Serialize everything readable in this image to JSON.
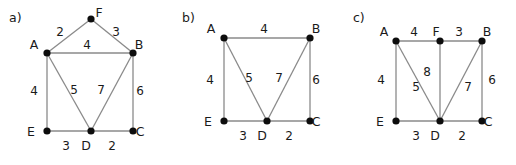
{
  "figure": {
    "width": 516,
    "height": 165,
    "background": "#ffffff",
    "edge_color": "#8a8a8a",
    "node_color": "#0d0d0d",
    "text_color": "#1a1a1a"
  },
  "panels": [
    {
      "id": "a",
      "label": "a)",
      "label_pos": {
        "x": 9,
        "y": 22
      },
      "nodes": [
        {
          "id": "F",
          "label": "F",
          "x": 91,
          "y": 19,
          "label_x": 99,
          "label_y": 17
        },
        {
          "id": "A",
          "label": "A",
          "x": 47,
          "y": 53,
          "label_x": 34,
          "label_y": 49
        },
        {
          "id": "B",
          "label": "B",
          "x": 133,
          "y": 53,
          "label_x": 139,
          "label_y": 49
        },
        {
          "id": "E",
          "label": "E",
          "x": 47,
          "y": 131,
          "label_x": 31,
          "label_y": 136
        },
        {
          "id": "D",
          "label": "D",
          "x": 91,
          "y": 131,
          "label_x": 86,
          "label_y": 150
        },
        {
          "id": "C",
          "label": "C",
          "x": 133,
          "y": 131,
          "label_x": 140,
          "label_y": 136
        }
      ],
      "edges": [
        {
          "from": "A",
          "to": "F",
          "weight": "2",
          "label_x": 60,
          "label_y": 36
        },
        {
          "from": "F",
          "to": "B",
          "weight": "3",
          "label_x": 116,
          "label_y": 36
        },
        {
          "from": "A",
          "to": "B",
          "weight": "4",
          "label_x": 87,
          "label_y": 49
        },
        {
          "from": "A",
          "to": "E",
          "weight": "4",
          "label_x": 34,
          "label_y": 95
        },
        {
          "from": "A",
          "to": "D",
          "weight": "5",
          "label_x": 74,
          "label_y": 94
        },
        {
          "from": "B",
          "to": "D",
          "weight": "7",
          "label_x": 101,
          "label_y": 94
        },
        {
          "from": "B",
          "to": "C",
          "weight": "6",
          "label_x": 140,
          "label_y": 95
        },
        {
          "from": "E",
          "to": "D",
          "weight": "3",
          "label_x": 66,
          "label_y": 150
        },
        {
          "from": "D",
          "to": "C",
          "weight": "2",
          "label_x": 112,
          "label_y": 150
        }
      ]
    },
    {
      "id": "b",
      "label": "b)",
      "label_pos": {
        "x": 182,
        "y": 22
      },
      "nodes": [
        {
          "id": "A",
          "label": "A",
          "x": 224,
          "y": 38,
          "label_x": 211,
          "label_y": 33
        },
        {
          "id": "B",
          "label": "B",
          "x": 310,
          "y": 38,
          "label_x": 316,
          "label_y": 33
        },
        {
          "id": "E",
          "label": "E",
          "x": 224,
          "y": 121,
          "label_x": 208,
          "label_y": 126
        },
        {
          "id": "D",
          "label": "D",
          "x": 267,
          "y": 121,
          "label_x": 262,
          "label_y": 140
        },
        {
          "id": "C",
          "label": "C",
          "x": 310,
          "y": 121,
          "label_x": 316,
          "label_y": 126
        }
      ],
      "edges": [
        {
          "from": "A",
          "to": "B",
          "weight": "4",
          "label_x": 264,
          "label_y": 33
        },
        {
          "from": "A",
          "to": "E",
          "weight": "4",
          "label_x": 210,
          "label_y": 84
        },
        {
          "from": "A",
          "to": "D",
          "weight": "5",
          "label_x": 249,
          "label_y": 82
        },
        {
          "from": "B",
          "to": "D",
          "weight": "7",
          "label_x": 279,
          "label_y": 82
        },
        {
          "from": "B",
          "to": "C",
          "weight": "6",
          "label_x": 316,
          "label_y": 84
        },
        {
          "from": "E",
          "to": "D",
          "weight": "3",
          "label_x": 243,
          "label_y": 140
        },
        {
          "from": "D",
          "to": "C",
          "weight": "2",
          "label_x": 289,
          "label_y": 140
        }
      ]
    },
    {
      "id": "c",
      "label": "c)",
      "label_pos": {
        "x": 353,
        "y": 22
      },
      "nodes": [
        {
          "id": "A",
          "label": "A",
          "x": 396,
          "y": 41,
          "label_x": 384,
          "label_y": 36
        },
        {
          "id": "F",
          "label": "F",
          "x": 440,
          "y": 41,
          "label_x": 436,
          "label_y": 36
        },
        {
          "id": "B",
          "label": "B",
          "x": 482,
          "y": 41,
          "label_x": 487,
          "label_y": 36
        },
        {
          "id": "E",
          "label": "E",
          "x": 396,
          "y": 121,
          "label_x": 380,
          "label_y": 126
        },
        {
          "id": "D",
          "label": "D",
          "x": 440,
          "y": 121,
          "label_x": 435,
          "label_y": 140
        },
        {
          "id": "C",
          "label": "C",
          "x": 482,
          "y": 121,
          "label_x": 488,
          "label_y": 126
        }
      ],
      "edges": [
        {
          "from": "A",
          "to": "F",
          "weight": "4",
          "label_x": 414,
          "label_y": 36
        },
        {
          "from": "F",
          "to": "B",
          "weight": "3",
          "label_x": 459,
          "label_y": 36
        },
        {
          "from": "A",
          "to": "E",
          "weight": "4",
          "label_x": 381,
          "label_y": 84
        },
        {
          "from": "A",
          "to": "D",
          "weight": "5",
          "label_x": 416,
          "label_y": 91
        },
        {
          "from": "F",
          "to": "D",
          "weight": "8",
          "label_x": 427,
          "label_y": 76
        },
        {
          "from": "B",
          "to": "D",
          "weight": "7",
          "label_x": 468,
          "label_y": 91
        },
        {
          "from": "B",
          "to": "C",
          "weight": "6",
          "label_x": 492,
          "label_y": 84
        },
        {
          "from": "E",
          "to": "D",
          "weight": "3",
          "label_x": 416,
          "label_y": 140
        },
        {
          "from": "D",
          "to": "C",
          "weight": "2",
          "label_x": 462,
          "label_y": 140
        }
      ]
    }
  ]
}
